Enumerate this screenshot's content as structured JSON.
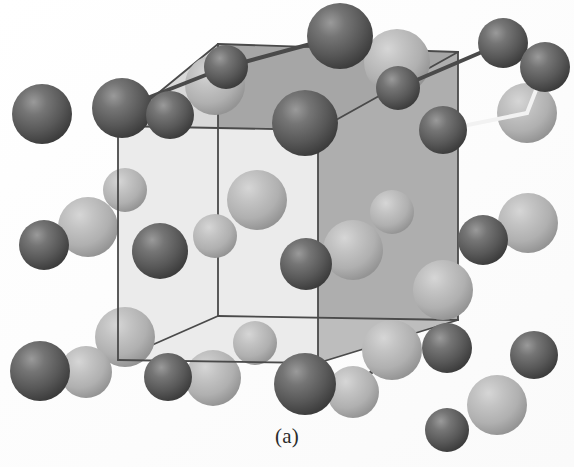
{
  "figure": {
    "caption": "(a)",
    "kind": "crystal-structure-unit-cell",
    "background_color": "#fdfdfd",
    "cell": {
      "edge_color": "#4a4a4a",
      "edge_width": 1.8,
      "faces": {
        "top_color": "#a6a6a6",
        "back_color": "#c4c4c4",
        "right_color": "#aeaeae",
        "bottom_color": "#bdbdbd",
        "front_color": "#ebebeb",
        "left_color": "#d8d8d8"
      },
      "vertices": {
        "front_bottom_left": [
          118,
          360
        ],
        "front_bottom_right": [
          318,
          363
        ],
        "front_top_left": [
          118,
          126
        ],
        "front_top_right": [
          318,
          130
        ],
        "back_bottom_left": [
          218,
          316
        ],
        "back_bottom_right": [
          458,
          320
        ],
        "back_top_left": [
          218,
          44
        ],
        "back_top_right": [
          458,
          52
        ]
      }
    },
    "atoms": {
      "dark": {
        "color_base": "#5f5f5f",
        "color_highlight": "#8e8e8e",
        "color_shadow": "#3b3b3b",
        "label": "dark-atom",
        "count": 24
      },
      "light": {
        "color_base": "#b4b4b4",
        "color_highlight": "#cfcfcf",
        "color_shadow": "#8f8f8f",
        "label": "light-atom",
        "count": 22
      },
      "bond_dark_color": "#4a4a4a",
      "bond_light_color": "#f2f2f2"
    },
    "dark_spheres": [
      {
        "cx": 122,
        "cy": 108,
        "r": 30,
        "name": "dark-corner-back-top-left-outer"
      },
      {
        "cx": 226,
        "cy": 67,
        "r": 22,
        "name": "dark-back-top-left-vertex"
      },
      {
        "cx": 340,
        "cy": 36,
        "r": 33,
        "name": "dark-back-top-edge-a"
      },
      {
        "cx": 503,
        "cy": 43,
        "r": 25,
        "name": "dark-back-top-edge-b"
      },
      {
        "cx": 170,
        "cy": 115,
        "r": 24,
        "name": "dark-front-top-edge-left"
      },
      {
        "cx": 305,
        "cy": 123,
        "r": 33,
        "name": "dark-front-top-right-vertex"
      },
      {
        "cx": 545,
        "cy": 67,
        "r": 25,
        "name": "dark-back-top-right-outer"
      },
      {
        "cx": 443,
        "cy": 130,
        "r": 24,
        "name": "dark-right-face-upper"
      },
      {
        "cx": 398,
        "cy": 88,
        "r": 22,
        "name": "dark-top-face-interior"
      },
      {
        "cx": 42,
        "cy": 114,
        "r": 30,
        "name": "dark-front-top-left-vertex"
      },
      {
        "cx": 44,
        "cy": 245,
        "r": 25,
        "name": "dark-front-left-edge-mid"
      },
      {
        "cx": 160,
        "cy": 251,
        "r": 28,
        "name": "dark-front-face-mid-left"
      },
      {
        "cx": 306,
        "cy": 264,
        "r": 26,
        "name": "dark-front-face-mid-right"
      },
      {
        "cx": 483,
        "cy": 240,
        "r": 25,
        "name": "dark-right-face-mid"
      },
      {
        "cx": 40,
        "cy": 371,
        "r": 30,
        "name": "dark-front-bottom-left-vertex"
      },
      {
        "cx": 168,
        "cy": 377,
        "r": 24,
        "name": "dark-front-bottom-edge"
      },
      {
        "cx": 305,
        "cy": 384,
        "r": 31,
        "name": "dark-front-bottom-right-vertex"
      },
      {
        "cx": 447,
        "cy": 348,
        "r": 25,
        "name": "dark-back-bottom-right-inner"
      },
      {
        "cx": 534,
        "cy": 355,
        "r": 24,
        "name": "dark-back-bottom-right-outer"
      },
      {
        "cx": 447,
        "cy": 430,
        "r": 22,
        "name": "dark-bottom-right-lower"
      }
    ],
    "light_spheres": [
      {
        "cx": 215,
        "cy": 85,
        "r": 30,
        "name": "light-top-face-front-left"
      },
      {
        "cx": 397,
        "cy": 62,
        "r": 33,
        "name": "light-top-face-back-right"
      },
      {
        "cx": 527,
        "cy": 113,
        "r": 30,
        "name": "light-right-face-top"
      },
      {
        "cx": 125,
        "cy": 190,
        "r": 22,
        "name": "light-back-face-upper-left"
      },
      {
        "cx": 88,
        "cy": 227,
        "r": 30,
        "name": "light-left-face-upper"
      },
      {
        "cx": 257,
        "cy": 200,
        "r": 30,
        "name": "light-interior-upper-mid"
      },
      {
        "cx": 215,
        "cy": 236,
        "r": 22,
        "name": "light-interior-small-mid"
      },
      {
        "cx": 392,
        "cy": 212,
        "r": 22,
        "name": "light-back-face-right-upper"
      },
      {
        "cx": 353,
        "cy": 250,
        "r": 30,
        "name": "light-interior-right-mid"
      },
      {
        "cx": 528,
        "cy": 223,
        "r": 30,
        "name": "light-right-face-lower"
      },
      {
        "cx": 443,
        "cy": 290,
        "r": 30,
        "name": "light-right-face-bottom-upper"
      },
      {
        "cx": 125,
        "cy": 337,
        "r": 30,
        "name": "light-bottom-face-left"
      },
      {
        "cx": 86,
        "cy": 372,
        "r": 26,
        "name": "light-left-face-lower"
      },
      {
        "cx": 255,
        "cy": 343,
        "r": 22,
        "name": "light-bottom-face-mid-small"
      },
      {
        "cx": 213,
        "cy": 378,
        "r": 28,
        "name": "light-bottom-face-front"
      },
      {
        "cx": 392,
        "cy": 350,
        "r": 30,
        "name": "light-bottom-face-back-right"
      },
      {
        "cx": 353,
        "cy": 392,
        "r": 26,
        "name": "light-bottom-face-right-front"
      },
      {
        "cx": 497,
        "cy": 405,
        "r": 30,
        "name": "light-bottom-right-outer"
      }
    ],
    "bonds": [
      {
        "x1": 340,
        "y1": 36,
        "x2": 226,
        "y2": 67,
        "color": "#4a4a4a",
        "w": 4,
        "name": "bond-top-back-left"
      },
      {
        "x1": 226,
        "y1": 67,
        "x2": 122,
        "y2": 108,
        "color": "#4a4a4a",
        "w": 4,
        "name": "bond-top-left-outer"
      },
      {
        "x1": 398,
        "y1": 88,
        "x2": 503,
        "y2": 43,
        "color": "#4a4a4a",
        "w": 4,
        "name": "bond-top-back-right"
      },
      {
        "x1": 527,
        "y1": 113,
        "x2": 545,
        "y2": 67,
        "color": "#f2f2f2",
        "w": 4,
        "name": "bond-right-upper-white"
      },
      {
        "x1": 443,
        "y1": 130,
        "x2": 527,
        "y2": 113,
        "color": "#f2f2f2",
        "w": 4,
        "name": "bond-right-face-white"
      },
      {
        "x1": 392,
        "y1": 350,
        "x2": 353,
        "y2": 392,
        "color": "#4a4a4a",
        "w": 4,
        "name": "bond-bottom-right-a"
      },
      {
        "x1": 353,
        "y1": 392,
        "x2": 305,
        "y2": 384,
        "color": "#4a4a4a",
        "w": 4,
        "name": "bond-bottom-right-b"
      }
    ]
  }
}
